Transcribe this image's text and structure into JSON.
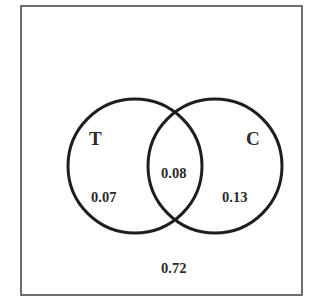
{
  "diagram": {
    "type": "venn",
    "universe": {
      "label": "",
      "outside_value": "0.72"
    },
    "sets": [
      {
        "name": "T",
        "only_value": "0.07"
      },
      {
        "name": "C",
        "only_value": "0.13"
      }
    ],
    "intersection": {
      "sets": [
        "T",
        "C"
      ],
      "value": "0.08"
    },
    "colors": {
      "stroke": "#1e1e1e",
      "frame": "#4a4a4a",
      "text": "#2a2a2a",
      "background": "#ffffff"
    }
  }
}
